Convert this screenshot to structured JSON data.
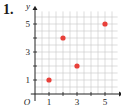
{
  "problem_label": "1.",
  "chart_data": {
    "type": "scatter",
    "title": "",
    "xlabel": "x",
    "ylabel": "y",
    "origin_label": "O",
    "x": [
      1,
      2,
      3,
      5
    ],
    "y": [
      1,
      4,
      2,
      5
    ],
    "points": [
      [
        1,
        1
      ],
      [
        2,
        4
      ],
      [
        3,
        2
      ],
      [
        5,
        5
      ]
    ],
    "xlim": [
      0,
      6
    ],
    "ylim": [
      0,
      6
    ],
    "xticks": [
      1,
      3,
      5
    ],
    "yticks": [
      1,
      3,
      5
    ],
    "grid": true,
    "point_color": "#e8403a",
    "grid_color": "#c8c8c8"
  }
}
